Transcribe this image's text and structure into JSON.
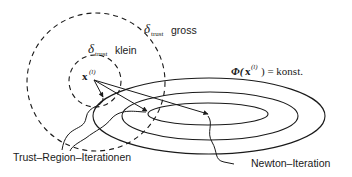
{
  "diagram": {
    "labels": {
      "delta_big_symbol": "δ",
      "delta_big_sub": "trust",
      "delta_big_word": "gross",
      "delta_small_symbol": "δ",
      "delta_small_sub": "trust",
      "delta_small_word": "klein",
      "x_symbol": "x",
      "x_sup": "(l)",
      "contour_phi": "Φ(",
      "contour_x": "x",
      "contour_sup": "(l)",
      "contour_rest": ") = konst.",
      "trust_region_iterations": "Trust–Region–Iterationen",
      "newton_iteration": "Newton–Iteration"
    },
    "colors": {
      "stroke": "#1a1a1a",
      "background": "#ffffff"
    }
  }
}
